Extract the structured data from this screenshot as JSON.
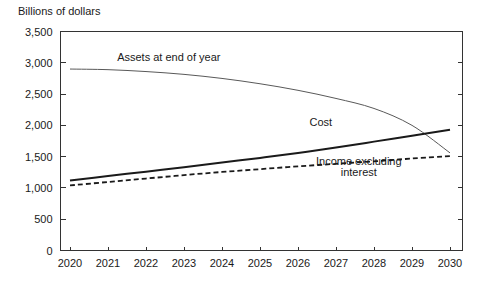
{
  "chart_data": {
    "type": "line",
    "title": "",
    "subtitle": "",
    "ylabel": "Billions of dollars",
    "xlabel": "",
    "x": [
      2020,
      2021,
      2022,
      2023,
      2024,
      2025,
      2026,
      2027,
      2028,
      2029,
      2030
    ],
    "xtick_labels": [
      "2020",
      "2021",
      "2022",
      "2023",
      "2024",
      "2025",
      "2026",
      "2027",
      "2028",
      "2029",
      "2030"
    ],
    "xlim": [
      2020,
      2030
    ],
    "ylim": [
      0,
      3500
    ],
    "ytick_values": [
      0,
      500,
      1000,
      1500,
      2000,
      2500,
      3000,
      3500
    ],
    "ytick_labels": [
      "0",
      "500",
      "1,000",
      "1,500",
      "2,000",
      "2,500",
      "3,000",
      "3,500"
    ],
    "grid": false,
    "legend_position": "inline-annotations",
    "series": [
      {
        "name": "Assets at end of year",
        "style": "solid-thin",
        "color": "#595959",
        "values": [
          2900,
          2890,
          2860,
          2815,
          2750,
          2665,
          2560,
          2430,
          2270,
          2000,
          1560
        ]
      },
      {
        "name": "Cost",
        "style": "solid-thick",
        "color": "#1a1a1a",
        "values": [
          1120,
          1190,
          1260,
          1330,
          1405,
          1480,
          1560,
          1645,
          1740,
          1835,
          1930
        ]
      },
      {
        "name": "Income excluding interest",
        "style": "dashed",
        "color": "#1a1a1a",
        "values": [
          1040,
          1095,
          1150,
          1205,
          1255,
          1300,
          1345,
          1385,
          1425,
          1470,
          1510
        ]
      }
    ],
    "annotations": [
      {
        "text": "Assets at end of year",
        "x": 2022.6,
        "y": 3030
      },
      {
        "text": "Cost",
        "x": 2026.6,
        "y": 1990
      },
      {
        "text": "Income excluding",
        "x": 2027.6,
        "y": 1370
      },
      {
        "text": "interest",
        "x": 2027.6,
        "y": 1185
      }
    ]
  }
}
